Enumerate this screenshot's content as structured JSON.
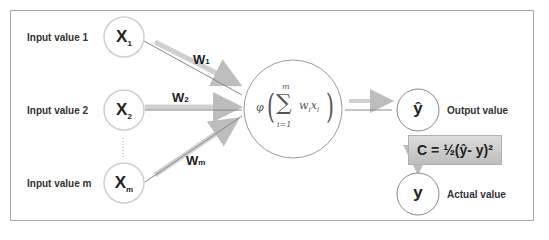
{
  "inputs": [
    {
      "label": "Input value 1",
      "node": "X",
      "sub": "1",
      "weight": "W",
      "weight_sub": "1"
    },
    {
      "label": "Input value 2",
      "node": "X",
      "sub": "2",
      "weight": "W",
      "weight_sub": "2"
    },
    {
      "label": "Input value m",
      "node": "X",
      "sub": "m",
      "weight": "W",
      "weight_sub": "m"
    }
  ],
  "neuron": {
    "phi": "φ",
    "sum_symbol": "∑",
    "upper": "m",
    "lower": "i=1",
    "term": "w",
    "term_sub": "i",
    "term2": "x",
    "term2_sub": "i"
  },
  "output": {
    "node": "ŷ",
    "label": "Output value"
  },
  "actual": {
    "node": "y",
    "label": "Actual value"
  },
  "cost": {
    "formula": "C = ½(ŷ- y)²"
  },
  "colors": {
    "arrow": "#c8c8c8",
    "line": "#888888",
    "border": "#a8a8a8",
    "cost_bg": "#cfcfcf"
  }
}
